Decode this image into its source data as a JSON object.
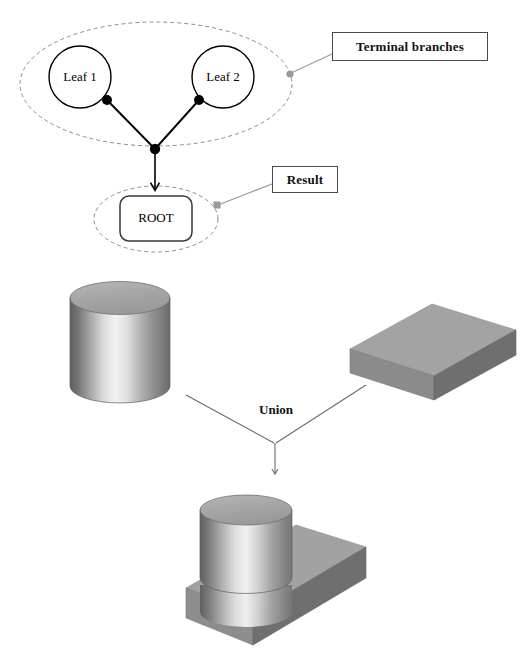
{
  "figure": {
    "background_color": "#ffffff"
  },
  "tree": {
    "leaf1": {
      "label": "Leaf 1",
      "shape": "circle"
    },
    "leaf2": {
      "label": "Leaf 2",
      "shape": "circle"
    },
    "root": {
      "label": "ROOT",
      "shape": "rounded-rectangle"
    },
    "group_outline": "dashed-ellipse"
  },
  "callouts": [
    {
      "id": "terminal-branches",
      "label": "Terminal branches",
      "connector_color": "#8c8c8c"
    },
    {
      "id": "result",
      "label": "Result",
      "connector_color": "#8c8c8c"
    }
  ],
  "operation": {
    "label": "Union",
    "arrow_color": "#6b6b6b"
  },
  "solids": {
    "cylinder": {
      "name": "cylinder",
      "top_color": "#a8a8a8",
      "body_light": "#f0f0f0",
      "body_dark": "#6e6e6e"
    },
    "block": {
      "name": "rectangular-block",
      "top_color": "#a2a2a2",
      "front_color": "#8a8a8a",
      "side_color": "#6f6f6f"
    },
    "result_solid": {
      "name": "union-result-solid",
      "top_color": "#a2a2a2",
      "front_color": "#8d8d8d",
      "side_color": "#6f6f6f"
    }
  },
  "colors": {
    "stroke_dark": "#000000",
    "stroke_gray": "#8c8c8c",
    "box_border": "#4a4a4a",
    "text": "#111111"
  }
}
